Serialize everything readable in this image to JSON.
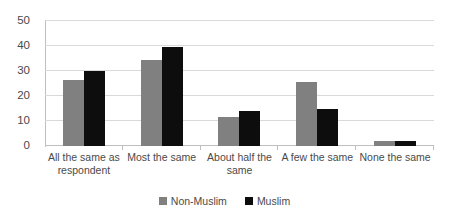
{
  "chart_data": {
    "type": "bar",
    "title": "",
    "subtitle": "",
    "xlabel": "",
    "ylabel": "",
    "ylim": [
      0,
      50
    ],
    "yticks": [
      0,
      10,
      20,
      30,
      40,
      50
    ],
    "ytick_labels": [
      "0",
      "10",
      "20",
      "30",
      "40",
      "50"
    ],
    "grid": true,
    "legend_position": "bottom",
    "categories": [
      "All the same as respondent",
      "Most the same",
      "About half the same",
      "A few the same",
      "None the same"
    ],
    "series": [
      {
        "name": "Non-Muslim",
        "color": "#808080",
        "values": [
          26.5,
          34.5,
          11.5,
          25.5,
          2.0
        ]
      },
      {
        "name": "Muslim",
        "color": "#0d0d0d",
        "values": [
          30.0,
          39.5,
          14.0,
          15.0,
          2.0
        ]
      }
    ]
  },
  "colors": {
    "non_muslim": "#808080",
    "muslim": "#0d0d0d",
    "gridline": "#d9d9d9",
    "axis": "#bfbfbf",
    "text": "#4a4a4a",
    "background": "#ffffff"
  }
}
